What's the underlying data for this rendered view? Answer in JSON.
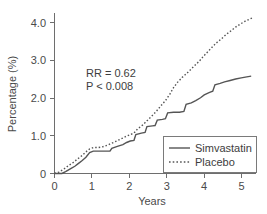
{
  "chart_data": {
    "type": "line",
    "title": "",
    "subtitle": "",
    "xlabel": "Years",
    "ylabel": "Percentage (%)",
    "xlim": [
      0,
      5.45
    ],
    "ylim": [
      0,
      4.45
    ],
    "xticks": [
      "0",
      "1",
      "2",
      "3",
      "4",
      "5"
    ],
    "xtick_values": [
      0,
      1,
      2,
      3,
      4,
      5
    ],
    "yticks": [
      "0",
      "1.0",
      "2.0",
      "3.0",
      "4.0"
    ],
    "ytick_values": [
      0,
      1.0,
      2.0,
      3.0,
      4.0
    ],
    "grid": false,
    "legend_position": "lower-right",
    "annotations": [
      {
        "text": "RR = 0.62",
        "style": "normal",
        "x": 0.85,
        "y": 2.55
      },
      {
        "text": "P < 0.008",
        "style": "italic-first-char",
        "x": 0.85,
        "y": 2.28
      }
    ],
    "series": [
      {
        "name": "Simvastatin",
        "style": "solid",
        "color": "#555555",
        "points": [
          [
            0.0,
            0.0
          ],
          [
            0.2,
            0.0
          ],
          [
            0.3,
            0.05
          ],
          [
            0.45,
            0.14
          ],
          [
            0.55,
            0.2
          ],
          [
            0.65,
            0.28
          ],
          [
            0.75,
            0.36
          ],
          [
            0.85,
            0.45
          ],
          [
            0.95,
            0.58
          ],
          [
            1.05,
            0.62
          ],
          [
            1.2,
            0.62
          ],
          [
            1.35,
            0.62
          ],
          [
            1.5,
            0.62
          ],
          [
            1.55,
            0.7
          ],
          [
            1.7,
            0.75
          ],
          [
            1.85,
            0.8
          ],
          [
            1.95,
            0.86
          ],
          [
            2.05,
            0.9
          ],
          [
            2.15,
            0.92
          ],
          [
            2.2,
            1.08
          ],
          [
            2.35,
            1.12
          ],
          [
            2.45,
            1.14
          ],
          [
            2.5,
            1.3
          ],
          [
            2.65,
            1.32
          ],
          [
            2.72,
            1.33
          ],
          [
            2.78,
            1.48
          ],
          [
            2.92,
            1.5
          ],
          [
            3.0,
            1.52
          ],
          [
            3.06,
            1.68
          ],
          [
            3.22,
            1.7
          ],
          [
            3.38,
            1.7
          ],
          [
            3.5,
            1.72
          ],
          [
            3.56,
            1.92
          ],
          [
            3.7,
            1.96
          ],
          [
            3.82,
            2.02
          ],
          [
            3.95,
            2.1
          ],
          [
            4.05,
            2.18
          ],
          [
            4.18,
            2.24
          ],
          [
            4.28,
            2.28
          ],
          [
            4.34,
            2.46
          ],
          [
            4.48,
            2.5
          ],
          [
            4.6,
            2.54
          ],
          [
            4.75,
            2.58
          ],
          [
            4.9,
            2.62
          ],
          [
            5.05,
            2.65
          ],
          [
            5.2,
            2.68
          ],
          [
            5.32,
            2.7
          ]
        ]
      },
      {
        "name": "Placebo",
        "style": "dotted",
        "color": "#555555",
        "points": [
          [
            0.0,
            0.0
          ],
          [
            0.12,
            0.04
          ],
          [
            0.25,
            0.12
          ],
          [
            0.38,
            0.22
          ],
          [
            0.5,
            0.3
          ],
          [
            0.62,
            0.4
          ],
          [
            0.75,
            0.5
          ],
          [
            0.85,
            0.6
          ],
          [
            0.95,
            0.68
          ],
          [
            1.05,
            0.72
          ],
          [
            1.18,
            0.72
          ],
          [
            1.3,
            0.74
          ],
          [
            1.42,
            0.78
          ],
          [
            1.55,
            0.84
          ],
          [
            1.68,
            0.9
          ],
          [
            1.8,
            0.96
          ],
          [
            1.92,
            1.02
          ],
          [
            2.05,
            1.08
          ],
          [
            2.15,
            1.12
          ],
          [
            2.25,
            1.24
          ],
          [
            2.38,
            1.34
          ],
          [
            2.5,
            1.46
          ],
          [
            2.62,
            1.58
          ],
          [
            2.75,
            1.72
          ],
          [
            2.88,
            1.88
          ],
          [
            3.0,
            2.02
          ],
          [
            3.12,
            2.2
          ],
          [
            3.22,
            2.38
          ],
          [
            3.32,
            2.52
          ],
          [
            3.45,
            2.66
          ],
          [
            3.58,
            2.78
          ],
          [
            3.7,
            2.9
          ],
          [
            3.82,
            3.02
          ],
          [
            3.92,
            3.12
          ],
          [
            4.02,
            3.24
          ],
          [
            4.15,
            3.38
          ],
          [
            4.28,
            3.52
          ],
          [
            4.4,
            3.64
          ],
          [
            4.52,
            3.74
          ],
          [
            4.65,
            3.86
          ],
          [
            4.78,
            3.96
          ],
          [
            4.9,
            4.06
          ],
          [
            5.02,
            4.14
          ],
          [
            5.15,
            4.22
          ],
          [
            5.28,
            4.28
          ],
          [
            5.36,
            4.32
          ]
        ]
      }
    ]
  },
  "legend": {
    "items": [
      {
        "label": "Simvastatin",
        "style": "solid"
      },
      {
        "label": "Placebo",
        "style": "dotted"
      }
    ]
  }
}
